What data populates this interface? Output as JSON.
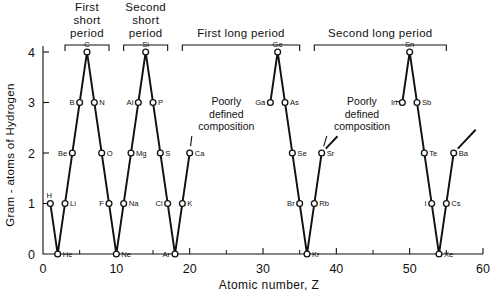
{
  "chart_data": {
    "type": "line",
    "title": "",
    "xlabel": "Atomic number,  Z",
    "ylabel": "Gram - atoms of Hydrogen",
    "xlim": [
      0,
      60
    ],
    "ylim": [
      0,
      4
    ],
    "grid": false,
    "legend": "none",
    "xticks": [
      0,
      10,
      20,
      30,
      40,
      50,
      60
    ],
    "xticklabels": [
      "0",
      "10",
      "20",
      "30",
      "40",
      "50",
      "60"
    ],
    "xminorticks": [
      5,
      15,
      25,
      35,
      45,
      55
    ],
    "yticks": [
      0,
      1,
      2,
      3,
      4
    ],
    "yticklabels": [
      "0",
      "1",
      "2",
      "3",
      "4"
    ],
    "series": [
      {
        "name": "Gram-atoms of Hydrogen per atom",
        "points": [
          {
            "label": "H",
            "x": 1,
            "y": 1,
            "label_pos": "above-left"
          },
          {
            "label": "He",
            "x": 2,
            "y": 0,
            "label_pos": "right"
          },
          {
            "label": "Li",
            "x": 3,
            "y": 1,
            "label_pos": "right"
          },
          {
            "label": "Be",
            "x": 4,
            "y": 2,
            "label_pos": "left"
          },
          {
            "label": "B",
            "x": 5,
            "y": 3,
            "label_pos": "left"
          },
          {
            "label": "C",
            "x": 6,
            "y": 4,
            "label_pos": "above"
          },
          {
            "label": "N",
            "x": 7,
            "y": 3,
            "label_pos": "right"
          },
          {
            "label": "O",
            "x": 8,
            "y": 2,
            "label_pos": "right"
          },
          {
            "label": "F",
            "x": 9,
            "y": 1,
            "label_pos": "left"
          },
          {
            "label": "Ne",
            "x": 10,
            "y": 0,
            "label_pos": "right"
          },
          {
            "label": "Na",
            "x": 11,
            "y": 1,
            "label_pos": "right"
          },
          {
            "label": "Mg",
            "x": 12,
            "y": 2,
            "label_pos": "right"
          },
          {
            "label": "Al",
            "x": 13,
            "y": 3,
            "label_pos": "left"
          },
          {
            "label": "Si",
            "x": 14,
            "y": 4,
            "label_pos": "above"
          },
          {
            "label": "P",
            "x": 15,
            "y": 3,
            "label_pos": "right"
          },
          {
            "label": "S",
            "x": 16,
            "y": 2,
            "label_pos": "right"
          },
          {
            "label": "Cl",
            "x": 17,
            "y": 1,
            "label_pos": "left"
          },
          {
            "label": "Ar",
            "x": 18,
            "y": 0,
            "label_pos": "left"
          },
          {
            "label": "K",
            "x": 19,
            "y": 1,
            "label_pos": "right"
          },
          {
            "label": "Ca",
            "x": 20,
            "y": 2,
            "label_pos": "right"
          },
          {
            "label": "Ga",
            "x": 31,
            "y": 3,
            "label_pos": "left"
          },
          {
            "label": "Ge",
            "x": 32,
            "y": 4,
            "label_pos": "above"
          },
          {
            "label": "As",
            "x": 33,
            "y": 3,
            "label_pos": "right"
          },
          {
            "label": "Se",
            "x": 34,
            "y": 2,
            "label_pos": "right"
          },
          {
            "label": "Br",
            "x": 35,
            "y": 1,
            "label_pos": "left"
          },
          {
            "label": "Kr",
            "x": 36,
            "y": 0,
            "label_pos": "right"
          },
          {
            "label": "Rb",
            "x": 37,
            "y": 1,
            "label_pos": "right"
          },
          {
            "label": "Sr",
            "x": 38,
            "y": 2,
            "label_pos": "right"
          },
          {
            "label": "In",
            "x": 49,
            "y": 3,
            "label_pos": "left"
          },
          {
            "label": "Sn",
            "x": 50,
            "y": 4,
            "label_pos": "above"
          },
          {
            "label": "Sb",
            "x": 51,
            "y": 3,
            "label_pos": "right"
          },
          {
            "label": "Te",
            "x": 52,
            "y": 2,
            "label_pos": "right"
          },
          {
            "label": "I",
            "x": 53,
            "y": 1,
            "label_pos": "left"
          },
          {
            "label": "Xe",
            "x": 54,
            "y": 0,
            "label_pos": "right"
          },
          {
            "label": "Cs",
            "x": 55,
            "y": 1,
            "label_pos": "right"
          },
          {
            "label": "Ba",
            "x": 56,
            "y": 2,
            "label_pos": "right"
          }
        ],
        "breaks": [
          "Ca->Ga",
          "Sr->In"
        ],
        "tails": [
          "Sr upward",
          "Ba upward"
        ]
      }
    ],
    "annotations": [
      {
        "text_lines": [
          "Poorly",
          "defined",
          "composition"
        ],
        "x": 25.0,
        "y": 2.95,
        "targets": [
          "Ga",
          "Ca"
        ]
      },
      {
        "text_lines": [
          "Poorly",
          "defined",
          "composition"
        ],
        "x": 43.5,
        "y": 2.95,
        "targets": [
          "In",
          "Sr"
        ]
      }
    ],
    "period_brackets": [
      {
        "label_lines": [
          "First",
          "short",
          "period"
        ],
        "x_start": 3,
        "x_end": 9
      },
      {
        "label_lines": [
          "Second",
          "short",
          "period"
        ],
        "x_start": 11,
        "x_end": 17
      },
      {
        "label_lines": [
          "First long period"
        ],
        "x_start": 19,
        "x_end": 35
      },
      {
        "label_lines": [
          "Second long period"
        ],
        "x_start": 37,
        "x_end": 55
      }
    ]
  }
}
